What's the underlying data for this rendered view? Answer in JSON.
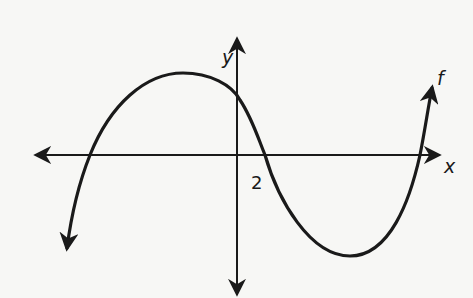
{
  "diagram": {
    "type": "function-graph",
    "axes": {
      "x_label": "x",
      "y_label": "y"
    },
    "function_label": "f",
    "marked_x_intercept_label": "2",
    "colors": {
      "background": "#f7f7f5",
      "ink": "#1a1a1a"
    }
  }
}
